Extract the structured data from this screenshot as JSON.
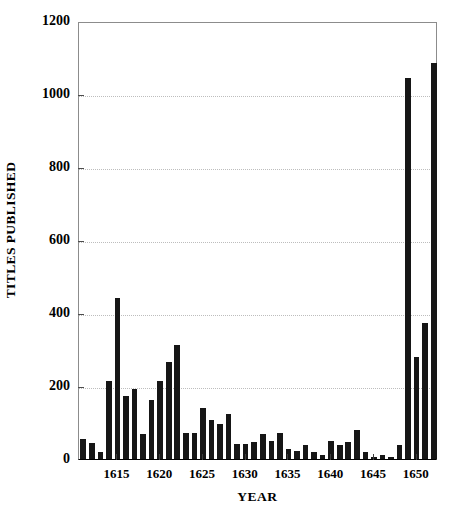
{
  "chart_data": {
    "type": "bar",
    "title": "",
    "xlabel": "YEAR",
    "ylabel": "TITLES PUBLISHED",
    "ylim": [
      0,
      1200
    ],
    "xlim": [
      1610.5,
      1652.5
    ],
    "grid": true,
    "legend": null,
    "bar_color": "#161616",
    "yticks": [
      0,
      200,
      400,
      600,
      800,
      1000,
      1200
    ],
    "ytick_labels": [
      "0",
      "200",
      "400",
      "600",
      "800",
      "1000",
      "1200"
    ],
    "xticks": [
      1615,
      1620,
      1625,
      1630,
      1635,
      1640,
      1645,
      1650
    ],
    "xtick_labels": [
      "1615",
      "1620",
      "1625",
      "1630",
      "1635",
      "1640",
      "1645",
      "1650"
    ],
    "categories": [
      1611,
      1612,
      1613,
      1614,
      1615,
      1616,
      1617,
      1618,
      1619,
      1620,
      1621,
      1622,
      1623,
      1624,
      1625,
      1626,
      1627,
      1628,
      1629,
      1630,
      1631,
      1632,
      1633,
      1634,
      1635,
      1636,
      1637,
      1638,
      1639,
      1640,
      1641,
      1642,
      1643,
      1644,
      1645,
      1646,
      1647,
      1648,
      1649,
      1650,
      1651,
      1652
    ],
    "values": [
      55,
      45,
      18,
      215,
      440,
      172,
      193,
      68,
      163,
      213,
      265,
      313,
      72,
      70,
      140,
      108,
      95,
      122,
      40,
      42,
      46,
      68,
      49,
      72,
      27,
      22,
      38,
      20,
      10,
      50,
      38,
      46,
      80,
      18,
      5,
      10,
      6,
      38,
      1045,
      280,
      372,
      1085
    ]
  }
}
